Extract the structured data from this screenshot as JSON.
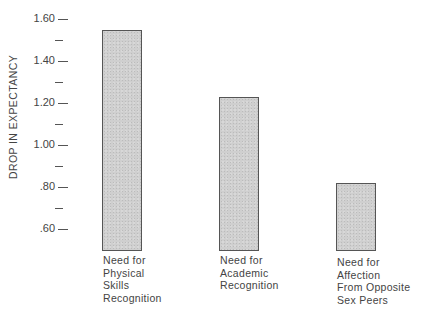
{
  "chart_data": {
    "type": "bar",
    "title": "",
    "xlabel": "",
    "ylabel": "DROP IN EXPECTANCY",
    "categories": [
      "Need for Physical Skills Recognition",
      "Need for Academic Recognition",
      "Need for Affection From Opposite Sex Peers"
    ],
    "category_lines": [
      [
        "Need for",
        "Physical",
        "Skills",
        "Recognition"
      ],
      [
        "Need for",
        "Academic",
        "Recognition"
      ],
      [
        "Need for",
        "Affection",
        "From Opposite",
        "Sex Peers"
      ]
    ],
    "values": [
      1.55,
      1.23,
      0.82
    ],
    "ylim": [
      0.55,
      1.6
    ],
    "yticks": [
      {
        "value": 1.6,
        "label": "1.60"
      },
      {
        "value": 1.5,
        "label": ""
      },
      {
        "value": 1.4,
        "label": "1.40"
      },
      {
        "value": 1.3,
        "label": ""
      },
      {
        "value": 1.2,
        "label": "1.20"
      },
      {
        "value": 1.1,
        "label": ""
      },
      {
        "value": 1.0,
        "label": "1.00"
      },
      {
        "value": 0.9,
        "label": ""
      },
      {
        "value": 0.8,
        "label": ".80"
      },
      {
        "value": 0.7,
        "label": ""
      },
      {
        "value": 0.6,
        "label": ".60"
      }
    ],
    "grid": false,
    "legend": null,
    "bar_color": "#cfcfcf",
    "bar_edge_color": "#555555"
  }
}
